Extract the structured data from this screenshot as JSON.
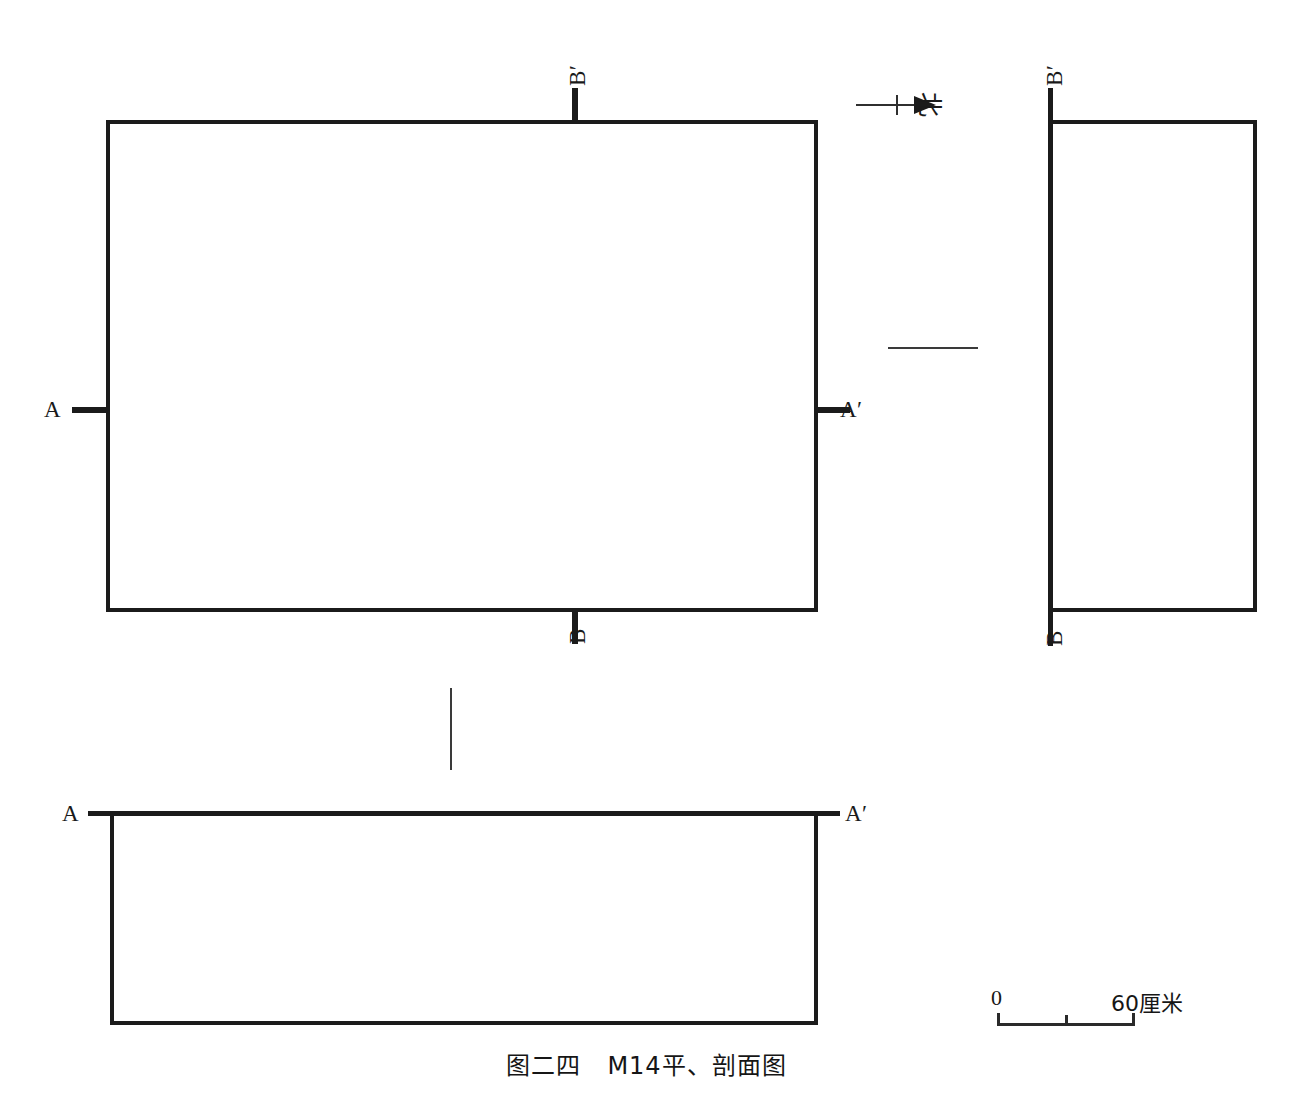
{
  "figure": {
    "caption_number": "图二四",
    "caption_title": "M14平、剖面图",
    "caption_full": "图二四　M14平、剖面图"
  },
  "north_arrow": {
    "name": "north-arrow",
    "character": "北",
    "direction": "right"
  },
  "scale_bar": {
    "start_label": "0",
    "end_label": "60厘米",
    "unit": "厘米",
    "max_value": 60,
    "ticks": [
      0,
      30,
      60
    ]
  },
  "plan_view": {
    "name": "M14 plan",
    "section_markers": {
      "a_left": "A",
      "a_right": "A′",
      "b_top": "B′",
      "b_bottom": "B"
    }
  },
  "section_bb": {
    "name": "B-B′ section",
    "top_label": "B′",
    "bottom_label": "B"
  },
  "section_aa": {
    "name": "A-A′ section",
    "left_label": "A",
    "right_label": "A′"
  },
  "colors": {
    "ink": "#1b1b1b",
    "thin_rule": "#3a3a3a",
    "background": "#ffffff"
  }
}
